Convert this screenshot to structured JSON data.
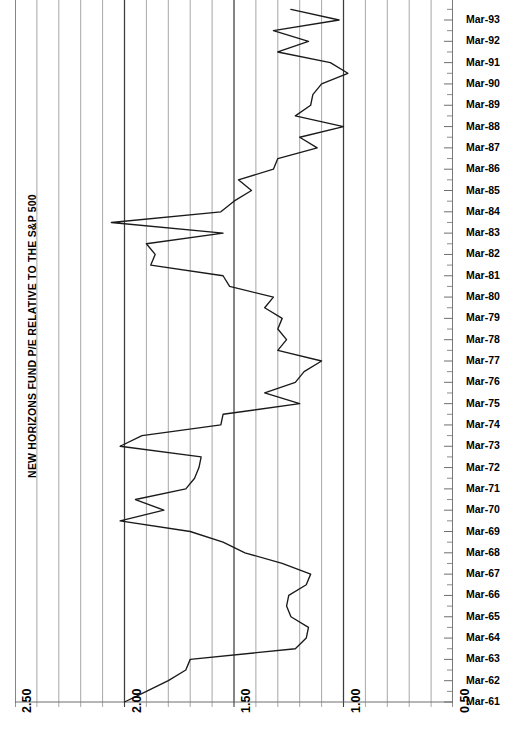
{
  "chart_data": {
    "type": "line",
    "title": "NEW HORIZONS FUND P/E RELATIVE TO THE S&P 500",
    "orientation": "horizontal-value-vertical-time",
    "xlabel": "",
    "ylabel": "",
    "grid": true,
    "legend": "none",
    "xlim": [
      2.5,
      0.5
    ],
    "x_axis_reversed": true,
    "x_major_ticks": [
      "2.50",
      "2.00",
      "1.50",
      "1.00",
      "0.50"
    ],
    "x_major_values": [
      2.5,
      2.0,
      1.5,
      1.0,
      0.5
    ],
    "x_minor_step": 0.1,
    "y_tick_labels": [
      "Mar-93",
      "Mar-92",
      "Mar-91",
      "Mar-90",
      "Mar-89",
      "Mar-88",
      "Mar-87",
      "Mar-86",
      "Mar-85",
      "Mar-84",
      "Mar-83",
      "Mar-82",
      "Mar-81",
      "Mar-80",
      "Mar-79",
      "Mar-78",
      "Mar-77",
      "Mar-76",
      "Mar-75",
      "Mar-74",
      "Mar-73",
      "Mar-72",
      "Mar-71",
      "Mar-70",
      "Mar-69",
      "Mar-68",
      "Mar-67",
      "Mar-66",
      "Mar-65",
      "Mar-64",
      "Mar-63",
      "Mar-62",
      "Mar-61"
    ],
    "y_minor_ticks_per_year": 2,
    "series": [
      {
        "name": "New Horizons Fund P/E relative to S&P 500",
        "color": "#1a1a1a",
        "points": [
          {
            "date": "Mar-61",
            "value": 2.0
          },
          {
            "date": "Sep-61",
            "value": 1.9
          },
          {
            "date": "Mar-62",
            "value": 1.8
          },
          {
            "date": "Sep-62",
            "value": 1.72
          },
          {
            "date": "Mar-63",
            "value": 1.7
          },
          {
            "date": "Sep-63",
            "value": 1.22
          },
          {
            "date": "Mar-64",
            "value": 1.17
          },
          {
            "date": "Sep-64",
            "value": 1.16
          },
          {
            "date": "Mar-65",
            "value": 1.24
          },
          {
            "date": "Sep-65",
            "value": 1.26
          },
          {
            "date": "Mar-66",
            "value": 1.25
          },
          {
            "date": "Sep-66",
            "value": 1.17
          },
          {
            "date": "Mar-67",
            "value": 1.15
          },
          {
            "date": "Sep-67",
            "value": 1.28
          },
          {
            "date": "Mar-68",
            "value": 1.45
          },
          {
            "date": "Sep-68",
            "value": 1.55
          },
          {
            "date": "Mar-69",
            "value": 1.7
          },
          {
            "date": "Sep-69",
            "value": 2.02
          },
          {
            "date": "Mar-70",
            "value": 1.82
          },
          {
            "date": "Sep-70",
            "value": 1.95
          },
          {
            "date": "Mar-71",
            "value": 1.72
          },
          {
            "date": "Sep-71",
            "value": 1.68
          },
          {
            "date": "Mar-72",
            "value": 1.66
          },
          {
            "date": "Sep-72",
            "value": 1.65
          },
          {
            "date": "Mar-73",
            "value": 2.02
          },
          {
            "date": "Sep-73",
            "value": 1.92
          },
          {
            "date": "Mar-74",
            "value": 1.56
          },
          {
            "date": "Sep-74",
            "value": 1.55
          },
          {
            "date": "Mar-75",
            "value": 1.2
          },
          {
            "date": "Sep-75",
            "value": 1.36
          },
          {
            "date": "Mar-76",
            "value": 1.22
          },
          {
            "date": "Sep-76",
            "value": 1.18
          },
          {
            "date": "Mar-77",
            "value": 1.1
          },
          {
            "date": "Sep-77",
            "value": 1.3
          },
          {
            "date": "Mar-78",
            "value": 1.26
          },
          {
            "date": "Sep-78",
            "value": 1.3
          },
          {
            "date": "Mar-79",
            "value": 1.28
          },
          {
            "date": "Sep-79",
            "value": 1.36
          },
          {
            "date": "Mar-80",
            "value": 1.32
          },
          {
            "date": "Sep-80",
            "value": 1.52
          },
          {
            "date": "Mar-81",
            "value": 1.55
          },
          {
            "date": "Sep-81",
            "value": 1.88
          },
          {
            "date": "Mar-82",
            "value": 1.86
          },
          {
            "date": "Sep-82",
            "value": 1.9
          },
          {
            "date": "Mar-83",
            "value": 1.55
          },
          {
            "date": "Sep-83",
            "value": 2.06
          },
          {
            "date": "Mar-84",
            "value": 1.56
          },
          {
            "date": "Sep-84",
            "value": 1.5
          },
          {
            "date": "Mar-85",
            "value": 1.42
          },
          {
            "date": "Sep-85",
            "value": 1.48
          },
          {
            "date": "Mar-86",
            "value": 1.32
          },
          {
            "date": "Sep-86",
            "value": 1.3
          },
          {
            "date": "Mar-87",
            "value": 1.12
          },
          {
            "date": "Sep-87",
            "value": 1.2
          },
          {
            "date": "Mar-88",
            "value": 1.0
          },
          {
            "date": "Sep-88",
            "value": 1.22
          },
          {
            "date": "Mar-89",
            "value": 1.15
          },
          {
            "date": "Sep-89",
            "value": 1.14
          },
          {
            "date": "Mar-90",
            "value": 1.1
          },
          {
            "date": "Sep-90",
            "value": 0.98
          },
          {
            "date": "Mar-91",
            "value": 1.06
          },
          {
            "date": "Sep-91",
            "value": 1.3
          },
          {
            "date": "Mar-92",
            "value": 1.16
          },
          {
            "date": "Sep-92",
            "value": 1.32
          },
          {
            "date": "Mar-93",
            "value": 1.02
          },
          {
            "date": "Sep-93",
            "value": 1.24
          }
        ]
      }
    ]
  },
  "axes": {
    "x_labels": [
      {
        "text": "2.50",
        "value": 2.5
      },
      {
        "text": "2.00",
        "value": 2.0
      },
      {
        "text": "1.50",
        "value": 1.5
      },
      {
        "text": "1.00",
        "value": 1.0
      },
      {
        "text": "0.50",
        "value": 0.5
      }
    ]
  },
  "colors": {
    "line": "#1a1a1a",
    "grid": "#8a8a8a",
    "grid_major": "#3c3c3c",
    "axis": "#6e6e6e",
    "text": "#000000"
  }
}
